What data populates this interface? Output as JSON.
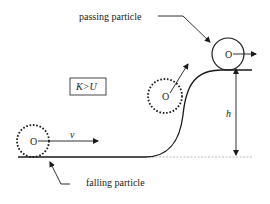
{
  "diagram": {
    "labels": {
      "passing": "passing particle",
      "falling": "falling particle",
      "condition": "K>U",
      "velocity": "v",
      "height": "h",
      "center": "O"
    },
    "colors": {
      "stroke": "#1a1a1a",
      "ground_dashed": "#aaaaaa",
      "background": "#ffffff"
    },
    "particles": [
      {
        "name": "falling-particle",
        "style": "dotted"
      },
      {
        "name": "climbing-particle",
        "style": "dotted"
      },
      {
        "name": "passing-particle",
        "style": "solid"
      }
    ]
  }
}
